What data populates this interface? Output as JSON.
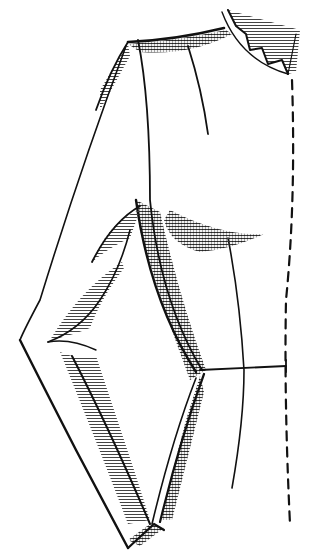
{
  "figure": {
    "style": "black ink line drawing with halftone hatching",
    "colors": {
      "background": "#ffffff",
      "ink": "#111111",
      "hatch": "#555555"
    },
    "parts": [
      {
        "id": "collar",
        "label": "zig-zag collar at neckline"
      },
      {
        "id": "shoulder",
        "label": "shoulder seam"
      },
      {
        "id": "sleeve",
        "label": "folded sleeve with elbow bend"
      },
      {
        "id": "side-seam",
        "label": "side seam"
      },
      {
        "id": "waistline",
        "label": "waistline with end tick"
      },
      {
        "id": "dart",
        "label": "front dart"
      },
      {
        "id": "center-front",
        "label": "dashed center front line"
      }
    ]
  }
}
